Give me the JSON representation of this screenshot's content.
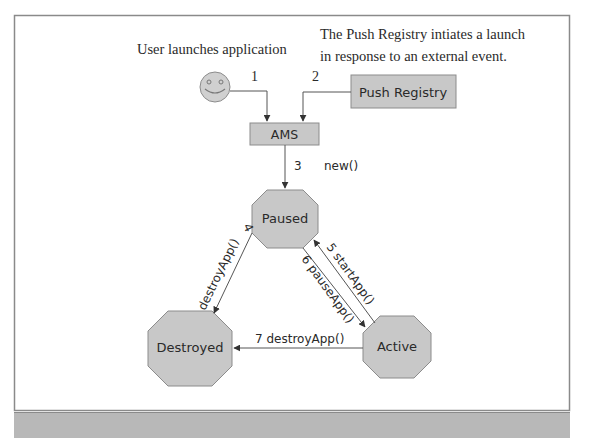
{
  "diagram": {
    "title_user": "User launches application",
    "title_push_line1": "The Push Registry intiates  a launch",
    "title_push_line2": "in response to an external event.",
    "nodes": {
      "push_registry": "Push Registry",
      "ams": "AMS",
      "paused": "Paused",
      "destroyed": "Destroyed",
      "active": "Active"
    },
    "edges": {
      "e1": "1",
      "e2": "2",
      "e3_num": "3",
      "e3_label": "new()",
      "e4_num": "4",
      "e4_label": "destroyApp()",
      "e5_label": "5  startApp()",
      "e6_label": "6  pauseApp()",
      "e7_label": "7 destroyApp()"
    },
    "colors": {
      "node_fill": "#c8c8c8",
      "node_stroke": "#8c8c8c",
      "line": "#555555",
      "frame": "#8a8a8a",
      "bottom_bar": "#b8b8b8"
    }
  }
}
